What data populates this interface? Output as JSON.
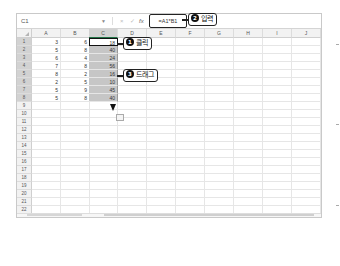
{
  "formula_bar": {
    "name_box": "C1",
    "cancel_icon": "×",
    "enter_icon": "✓",
    "fx_label": "fx",
    "formula": "=A1*B1"
  },
  "columns": [
    "A",
    "B",
    "C",
    "D",
    "E",
    "F",
    "G",
    "H",
    "I",
    "J"
  ],
  "selected_column": "C",
  "rows": [
    {
      "row": "1",
      "A": "3",
      "B": "6",
      "C": "18"
    },
    {
      "row": "2",
      "A": "5",
      "B": "8",
      "C": "40"
    },
    {
      "row": "3",
      "A": "6",
      "B": "4",
      "C": "24"
    },
    {
      "row": "4",
      "A": "7",
      "B": "8",
      "C": "56"
    },
    {
      "row": "5",
      "A": "8",
      "B": "2",
      "C": "16"
    },
    {
      "row": "6",
      "A": "2",
      "B": "5",
      "C": "10"
    },
    {
      "row": "7",
      "A": "5",
      "B": "9",
      "C": "45"
    },
    {
      "row": "8",
      "A": "5",
      "B": "8",
      "C": "40"
    },
    {
      "row": "9"
    },
    {
      "row": "10"
    },
    {
      "row": "11"
    },
    {
      "row": "12"
    },
    {
      "row": "13"
    },
    {
      "row": "14"
    },
    {
      "row": "15"
    },
    {
      "row": "16"
    },
    {
      "row": "17"
    },
    {
      "row": "18"
    },
    {
      "row": "19"
    },
    {
      "row": "20"
    },
    {
      "row": "21"
    },
    {
      "row": "22"
    }
  ],
  "annotations": {
    "step1": {
      "number": "1",
      "label": "클릭"
    },
    "step2": {
      "number": "2",
      "label": "입력"
    },
    "step3": {
      "number": "3",
      "label": "드래그"
    }
  },
  "colors": {
    "selection_fill": "#c6c6c6",
    "header_bg": "#f2f2f2",
    "accent": "#217346"
  }
}
